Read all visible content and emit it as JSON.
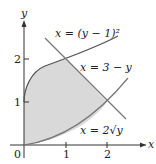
{
  "diagram": {
    "axes": {
      "x_label": "x",
      "y_label": "y",
      "origin_label": "0",
      "x_ticks": [
        "1",
        "2"
      ],
      "y_ticks": [
        "1",
        "2"
      ]
    },
    "curves": [
      {
        "id": "upper",
        "label": "x = (y − 1)²",
        "equation": "x=(y-1)^2"
      },
      {
        "id": "line",
        "label": "x = 3 − y",
        "equation": "x=3-y"
      },
      {
        "id": "lower",
        "label": "x = 2√y",
        "equation": "x=2*sqrt(y)"
      }
    ],
    "shaded_region": "bounded by x=(y-1)^2, x=3-y, x=2sqrt(y) and the y-axis",
    "colors": {
      "curve": "#555555",
      "axis": "#333333",
      "fill": "#d9d9d9"
    }
  }
}
